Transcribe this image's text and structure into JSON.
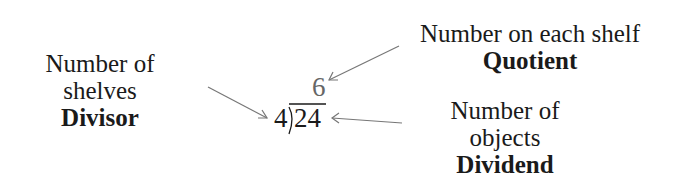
{
  "divisor": {
    "line1": "Number of",
    "line2": "shelves",
    "term": "Divisor"
  },
  "quotient": {
    "description": "Number on each shelf",
    "term": "Quotient"
  },
  "dividend": {
    "description": "Number of objects",
    "term": "Dividend"
  },
  "problem": {
    "divisor_value": "4",
    "dividend_value": "24",
    "quotient_value": "6"
  },
  "colors": {
    "text": "#1a1a1a",
    "arrow": "#777777",
    "quotient": "#666666"
  }
}
